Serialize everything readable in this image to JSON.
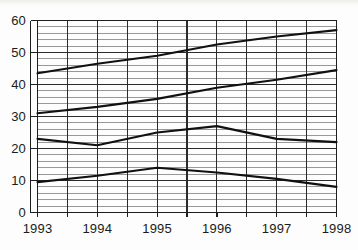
{
  "chart_data": {
    "type": "line",
    "title": "",
    "xlabel": "",
    "ylabel": "",
    "x": [
      "1993",
      "1994",
      "1995",
      "1996",
      "1997",
      "1998"
    ],
    "categories": [
      "1993",
      "1994",
      "1995",
      "1996",
      "1997",
      "1998"
    ],
    "ylim": [
      0,
      60
    ],
    "xlim": [
      "1993",
      "1998"
    ],
    "y_ticks": [
      "0",
      "10",
      "20",
      "30",
      "40",
      "50",
      "60"
    ],
    "y_tick_values": [
      0,
      10,
      20,
      30,
      40,
      50,
      60
    ],
    "y_minor_step": 2,
    "x_minor_step": 0.5,
    "grid": true,
    "grid_major_color": "#2b2b2b",
    "grid_minor_color": "#8d8d8d",
    "legend": "none",
    "line_color": "#111111",
    "series": [
      {
        "name": "series-1",
        "values": [
          43.5,
          46.5,
          49.0,
          52.5,
          55.0,
          57.0
        ]
      },
      {
        "name": "series-2",
        "values": [
          31.0,
          33.0,
          35.5,
          39.0,
          41.5,
          44.5
        ]
      },
      {
        "name": "series-3",
        "values": [
          23.0,
          21.0,
          25.0,
          27.0,
          23.0,
          22.0
        ]
      },
      {
        "name": "series-4",
        "values": [
          9.5,
          11.5,
          14.0,
          12.5,
          10.5,
          8.0
        ]
      }
    ]
  },
  "axes": {
    "y_labels": [
      "60",
      "50",
      "40",
      "30",
      "20",
      "10",
      "0"
    ],
    "x_labels": [
      "1993",
      "1994",
      "1995",
      "1996",
      "1997",
      "1998"
    ]
  }
}
